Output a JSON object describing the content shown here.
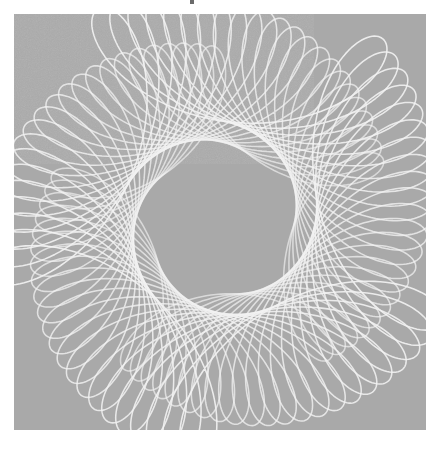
{
  "page": {
    "background_color": "#ffffff",
    "width": 440,
    "height": 449
  },
  "canvas": {
    "name": "plot-canvas",
    "background_color": "#a9a9a9",
    "line_color": "#f2f2f2",
    "left": 14,
    "top": 14,
    "width": 412,
    "height": 416,
    "texture": "paper-grain-noise"
  },
  "marks": {
    "top_speck_label": "",
    "top_speck_color": "#3a3a3a"
  },
  "chart_data": {
    "type": "line",
    "subtitle": "",
    "xlabel": "",
    "ylabel": "",
    "grid": false,
    "legend": null,
    "xlim": [
      -1.15,
      1.15
    ],
    "ylim": [
      -1.15,
      1.15
    ],
    "axis_visible": false,
    "tick_labels": [],
    "parametric": {
      "form": "x(t) = A1*cos(a*t + p1) * d(t) + A2*cos(b*t + p2) * d(t); y(t) = A1*sin(a*t + p1) * d(t) + A2*sin(b*t + p2) * d(t)",
      "a": 1,
      "b": -4,
      "amplitude_outer": 1.0,
      "amplitude_inner": 0.42,
      "phase_outer_deg": 0,
      "phase_inner_deg": 0,
      "t_start": 0,
      "t_end": 6.2832,
      "samples_per_curve": 420
    },
    "family": {
      "curve_count": 22,
      "rotation_step_deg": 3.4,
      "scale_step": 0.0135,
      "phase_step_deg": 2.2,
      "stroke_width": 0.9,
      "stroke_opacity": 0.92
    },
    "lobes": {
      "count": 5,
      "orientation_deg": 96,
      "cusp_nodes": [
        {
          "label": "node-left",
          "x": 145,
          "y": 240
        },
        {
          "label": "node-right",
          "x": 285,
          "y": 275
        }
      ]
    },
    "extent_px": {
      "figure_top": 48,
      "figure_bottom": 400,
      "figure_left": 27,
      "figure_right": 412
    }
  }
}
